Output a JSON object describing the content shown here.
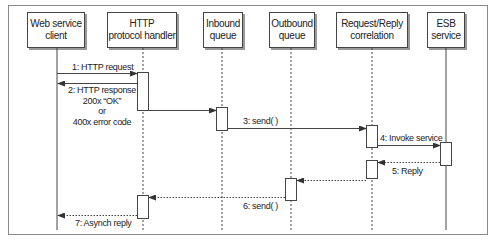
{
  "participants": [
    {
      "id": "client",
      "label": "Web service\nclient",
      "box": [
        27,
        12,
        58,
        36
      ],
      "lifeline_x": 57,
      "lifeline_style": "solid"
    },
    {
      "id": "http",
      "label": "HTTP\nprotocol handler",
      "box": [
        107,
        12,
        70,
        36
      ],
      "lifeline_x": 143,
      "lifeline_style": "dashed"
    },
    {
      "id": "inbound",
      "label": "Inbound\nqueue",
      "box": [
        203,
        12,
        40,
        36
      ],
      "lifeline_x": 222,
      "lifeline_style": "dashed"
    },
    {
      "id": "outbound",
      "label": "Outbound\nqueue",
      "box": [
        269,
        12,
        46,
        36
      ],
      "lifeline_x": 291,
      "lifeline_style": "dashed"
    },
    {
      "id": "correlation",
      "label": "Request/Reply\ncorrelation",
      "box": [
        336,
        12,
        72,
        36
      ],
      "lifeline_x": 372,
      "lifeline_style": "dashed"
    },
    {
      "id": "esb",
      "label": "ESB\nservice",
      "box": [
        427,
        12,
        38,
        36
      ],
      "lifeline_x": 446,
      "lifeline_style": "solid"
    }
  ],
  "messages": [
    {
      "id": "m1",
      "label": "1: HTTP request",
      "from": "client",
      "to": "http",
      "style": "solid"
    },
    {
      "id": "m2",
      "label": "2: HTTP response\n200x “OK”\nor\n400x error code",
      "from": "http",
      "to": "client",
      "style": "solid"
    },
    {
      "id": "m2b",
      "label": "",
      "from": "http",
      "to": "inbound",
      "style": "solid"
    },
    {
      "id": "m3",
      "label": "3: send( )",
      "from": "inbound",
      "to": "correlation",
      "style": "solid"
    },
    {
      "id": "m4",
      "label": "4: Invoke service",
      "from": "correlation",
      "to": "esb",
      "style": "solid"
    },
    {
      "id": "m5",
      "label": "5: Reply",
      "from": "esb",
      "to": "correlation",
      "style": "dotted"
    },
    {
      "id": "m5b",
      "label": "",
      "from": "correlation",
      "to": "outbound",
      "style": "dotted"
    },
    {
      "id": "m6",
      "label": "6: send( )",
      "from": "outbound",
      "to": "http",
      "style": "dotted"
    },
    {
      "id": "m7",
      "label": "7: Asynch reply",
      "from": "http",
      "to": "client",
      "style": "dotted"
    }
  ],
  "colors": {
    "line": "#444444",
    "frame": "#8a8a8a",
    "shadow": "#9a9a9a"
  }
}
